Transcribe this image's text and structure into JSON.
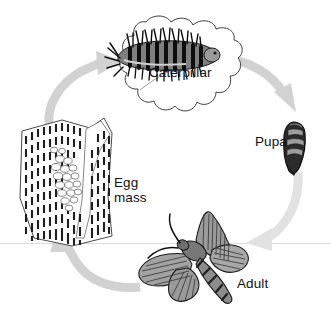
{
  "figure": {
    "background_color": "#ffffff",
    "horizon_line_color": "#d9d9d9",
    "arrow_color": "#d2d2d2",
    "ink_color": "#1a1a1a",
    "mid_gray": "#8a8a8a",
    "light_gray": "#b8b8b8"
  },
  "stages": {
    "caterpillar": {
      "label": "Caterpillar",
      "icon": "caterpillar-on-leaf-icon"
    },
    "pupa": {
      "label": "Pupa",
      "icon": "pupa-icon"
    },
    "egg_mass": {
      "label": "Egg\nmass",
      "icon": "egg-mass-on-bark-icon"
    },
    "adult": {
      "label": "Adult",
      "icon": "adult-moth-icon"
    }
  },
  "arrows": [
    {
      "name": "arrow-eggmass-to-caterpillar",
      "from": "egg_mass",
      "to": "caterpillar"
    },
    {
      "name": "arrow-caterpillar-to-pupa",
      "from": "caterpillar",
      "to": "pupa"
    },
    {
      "name": "arrow-pupa-to-adult",
      "from": "pupa",
      "to": "adult"
    },
    {
      "name": "arrow-adult-to-eggmass",
      "from": "adult",
      "to": "egg_mass"
    }
  ]
}
